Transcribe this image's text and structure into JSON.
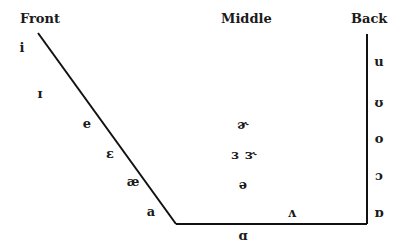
{
  "headings": {
    "front": "Front",
    "middle": "Middle",
    "back": "Back"
  },
  "front_vowels": [
    {
      "symbol": "i",
      "x": 22,
      "y": 47
    },
    {
      "symbol": "ɪ",
      "x": 40,
      "y": 93
    },
    {
      "symbol": "e",
      "x": 87,
      "y": 123
    },
    {
      "symbol": "ɛ",
      "x": 110,
      "y": 153
    },
    {
      "symbol": "æ",
      "x": 133,
      "y": 181
    },
    {
      "symbol": "a",
      "x": 151,
      "y": 211
    }
  ],
  "middle_vowels": [
    {
      "symbol": "ɚ",
      "x": 243,
      "y": 124
    },
    {
      "symbol": "ɜ",
      "x": 235,
      "y": 154
    },
    {
      "symbol": "ɝ",
      "x": 251,
      "y": 154
    },
    {
      "symbol": "ə",
      "x": 243,
      "y": 184
    },
    {
      "symbol": "ʌ",
      "x": 292,
      "y": 212
    },
    {
      "symbol": "ɑ",
      "x": 243,
      "y": 235
    }
  ],
  "back_vowels": [
    {
      "symbol": "u",
      "x": 379,
      "y": 61
    },
    {
      "symbol": "ʊ",
      "x": 379,
      "y": 102
    },
    {
      "symbol": "o",
      "x": 379,
      "y": 138
    },
    {
      "symbol": "ɔ",
      "x": 379,
      "y": 175
    },
    {
      "symbol": "ɒ",
      "x": 379,
      "y": 212
    }
  ],
  "chart_lines": {
    "front_diagonal": {
      "x1": 38,
      "y1": 33,
      "x2": 176,
      "y2": 224
    },
    "bottom": {
      "x1": 176,
      "y1": 224,
      "x2": 367,
      "y2": 224
    },
    "back_vertical": {
      "x1": 367,
      "y1": 34,
      "x2": 367,
      "y2": 224
    }
  }
}
